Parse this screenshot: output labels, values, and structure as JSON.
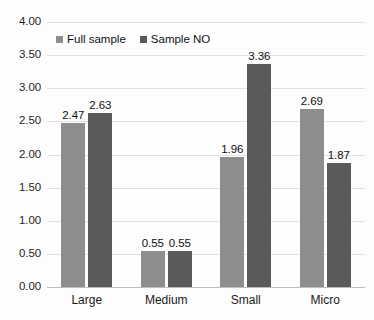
{
  "chart_data": {
    "type": "bar",
    "title": "",
    "subtitle": "",
    "xlabel": "",
    "ylabel": "",
    "categories": [
      "Large",
      "Medium",
      "Small",
      "Micro"
    ],
    "series": [
      {
        "name": "Full sample",
        "color": "#8d8d8d",
        "values": [
          2.47,
          0.55,
          1.96,
          2.69
        ]
      },
      {
        "name": "Sample NO",
        "color": "#5a5a5a",
        "values": [
          2.63,
          0.55,
          3.36,
          1.87
        ]
      }
    ],
    "ylim": [
      0,
      4
    ],
    "ytick_step": 0.5,
    "ytick_labels": [
      "4.00",
      "3.50",
      "3.00",
      "2.50",
      "2.00",
      "1.50",
      "1.00",
      "0.50",
      "0.00"
    ],
    "ytick_values": [
      4.0,
      3.5,
      3.0,
      2.5,
      2.0,
      1.5,
      1.0,
      0.5,
      0.0
    ],
    "data_labels": [
      [
        "2.47",
        "2.63"
      ],
      [
        "0.55",
        "0.55"
      ],
      [
        "1.96",
        "3.36"
      ],
      [
        "2.69",
        "1.87"
      ]
    ],
    "grid": true,
    "legend_position": "top-left",
    "background_color": "#fdfdfd",
    "grid_color": "#e2e2e2",
    "axis_color": "#bdbdbd"
  }
}
